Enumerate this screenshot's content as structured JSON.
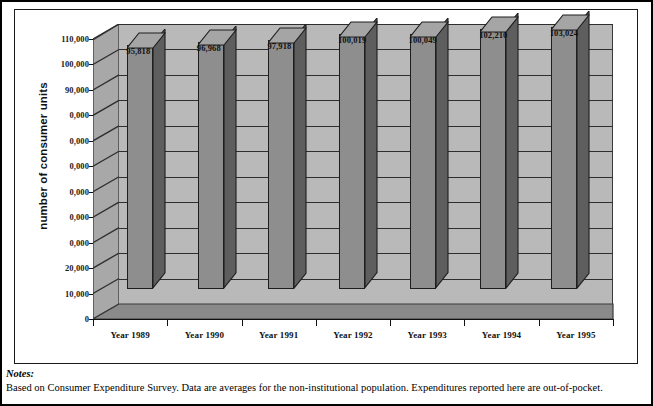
{
  "chart_data": {
    "type": "bar",
    "title": "",
    "xlabel": "",
    "ylabel": "number of consumer units",
    "categories": [
      "Year 1989",
      "Year 1990",
      "Year 1991",
      "Year 1992",
      "Year 1993",
      "Year 1994",
      "Year 1995"
    ],
    "values": [
      95818,
      96968,
      97918,
      100019,
      100049,
      102210,
      103024
    ],
    "value_labels": [
      "95,818",
      "96,968",
      "97,918",
      "100,019",
      "100,049",
      "102,210",
      "103,024"
    ],
    "ylim": [
      0,
      110000
    ],
    "ytick_values": [
      0,
      10000,
      20000,
      30000,
      40000,
      50000,
      60000,
      70000,
      80000,
      90000,
      100000,
      110000
    ],
    "ytick_labels": [
      "0",
      "10,000",
      "20,000",
      "0,000",
      "0,000",
      "0,000",
      "0,000",
      "0,000",
      "0,000",
      "90,000",
      "100,000",
      "110,000"
    ],
    "grid": true,
    "legend": "none",
    "style": "3d-column",
    "colors": {
      "bar_front": "#8e8e8e",
      "bar_side": "#5e5e5e",
      "bar_top": "#a5a5a5",
      "back_wall": "#b9b9b9",
      "side_wall": "#a8a8a8",
      "floor": "#8a8a8a",
      "axis": "#111111",
      "gridline": "#2e2e2e",
      "text": "#000000"
    }
  },
  "notes": {
    "label": "Notes:",
    "text": "Based on Consumer Expenditure Survey. Data are averages for the non-institutional population. Expenditures reported here are out-of-pocket."
  }
}
